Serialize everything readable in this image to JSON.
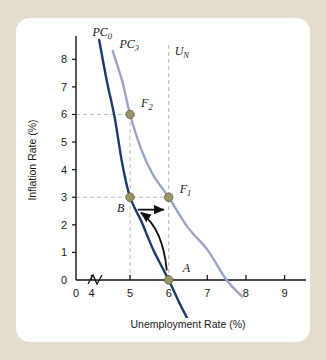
{
  "figure": {
    "background_color": "#e3ddd0",
    "card_color": "#ffffff"
  },
  "chart_data": {
    "type": "line",
    "title": "",
    "xlabel": "Unemployment Rate (%)",
    "ylabel": "Inflation Rate (%)",
    "xlim": [
      3.6,
      9.4
    ],
    "ylim": [
      0,
      8.7
    ],
    "x_ticks": [
      "0",
      "4",
      "5",
      "6",
      "7",
      "8",
      "9"
    ],
    "y_ticks": [
      "0",
      "1",
      "2",
      "3",
      "4",
      "5",
      "6",
      "7",
      "8"
    ],
    "grid": false,
    "axis_break_x": true,
    "legend_position": "inline-curve-labels",
    "series": [
      {
        "name": "PC0",
        "label_main": "PC",
        "label_sub": "0",
        "color": "#1b3a6b",
        "points": [
          {
            "x": 4.2,
            "y": 8.7
          },
          {
            "x": 4.4,
            "y": 7.2
          },
          {
            "x": 4.6,
            "y": 5.9
          },
          {
            "x": 4.8,
            "y": 4.2
          },
          {
            "x": 5.0,
            "y": 3.0
          },
          {
            "x": 5.3,
            "y": 2.1
          },
          {
            "x": 5.6,
            "y": 1.1
          },
          {
            "x": 6.0,
            "y": 0.0
          },
          {
            "x": 6.3,
            "y": -0.9
          },
          {
            "x": 6.6,
            "y": -1.7
          }
        ]
      },
      {
        "name": "PC3",
        "label_main": "PC",
        "label_sub": "3",
        "color": "#9aa4c8",
        "points": [
          {
            "x": 4.55,
            "y": 8.3
          },
          {
            "x": 4.8,
            "y": 7.2
          },
          {
            "x": 5.0,
            "y": 6.0
          },
          {
            "x": 5.3,
            "y": 4.7
          },
          {
            "x": 5.6,
            "y": 3.8
          },
          {
            "x": 6.0,
            "y": 3.0
          },
          {
            "x": 6.5,
            "y": 1.9
          },
          {
            "x": 7.0,
            "y": 1.1
          },
          {
            "x": 7.5,
            "y": 0.0
          },
          {
            "x": 7.9,
            "y": -0.6
          }
        ]
      }
    ],
    "vertical_lines": [
      {
        "name": "U_N",
        "label_main": "U",
        "label_sub": "N",
        "x": 6.0,
        "color": "#b8b8b8",
        "style": "dashed"
      }
    ],
    "guide_lines": [
      {
        "name": "y6-guide",
        "from": {
          "x": 3.6,
          "y": 6.0
        },
        "to": {
          "x": 5.0,
          "y": 6.0
        },
        "style": "dashed"
      },
      {
        "name": "y3-guide",
        "from": {
          "x": 3.6,
          "y": 3.0
        },
        "to": {
          "x": 6.0,
          "y": 3.0
        },
        "style": "dashed"
      },
      {
        "name": "x5-guide",
        "from": {
          "x": 5.0,
          "y": 0.0
        },
        "to": {
          "x": 5.0,
          "y": 6.0
        },
        "style": "dashed"
      }
    ],
    "annotations": [
      {
        "name": "point-A",
        "label_main": "A",
        "label_sub": "",
        "x": 6.0,
        "y": 0.0,
        "marker": true,
        "label_dx": 14,
        "label_dy": -8
      },
      {
        "name": "point-B",
        "label_main": "B",
        "label_sub": "",
        "x": 5.0,
        "y": 3.0,
        "marker": true,
        "label_dx": -13,
        "label_dy": 15
      },
      {
        "name": "point-F1",
        "label_main": "F",
        "label_sub": "1",
        "x": 6.0,
        "y": 3.0,
        "marker": true,
        "label_dx": 11,
        "label_dy": -4
      },
      {
        "name": "point-F2",
        "label_main": "F",
        "label_sub": "2",
        "x": 5.0,
        "y": 6.0,
        "marker": true,
        "label_dx": 11,
        "label_dy": -7
      }
    ],
    "arrows": [
      {
        "name": "arrow-A-to-B",
        "style": "curved",
        "from": {
          "x": 5.95,
          "y": 0.35
        },
        "to": {
          "x": 5.28,
          "y": 2.45
        }
      },
      {
        "name": "arrow-B-to-F1",
        "style": "straight",
        "from": {
          "x": 5.2,
          "y": 2.55
        },
        "to": {
          "x": 5.88,
          "y": 2.55
        }
      }
    ],
    "marker_style": {
      "fill": "#9a9566",
      "stroke": "#6f6b45",
      "radius": 4.2
    }
  }
}
